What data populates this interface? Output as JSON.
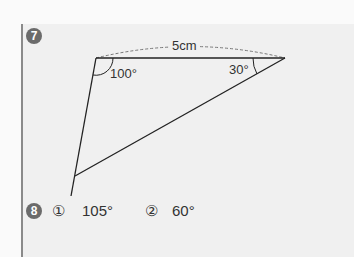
{
  "problem7": {
    "number": "7",
    "side_label": "5cm",
    "angle_left": "100°",
    "angle_right": "30°"
  },
  "problem8": {
    "number": "8",
    "items": [
      {
        "marker": "①",
        "value": "105°"
      },
      {
        "marker": "②",
        "value": "60°"
      }
    ]
  }
}
